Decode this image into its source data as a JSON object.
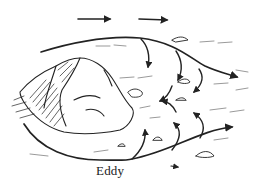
{
  "figure": {
    "label": "Eddy",
    "colors": {
      "ink": "#222222",
      "background": "#ffffff"
    },
    "elements": [
      "current-arrows-top",
      "main-flow-arrow-over-rock",
      "rock",
      "eddy-flow-arrows-below",
      "backflow-arrows",
      "small-stones",
      "water-ripple-marks"
    ]
  }
}
